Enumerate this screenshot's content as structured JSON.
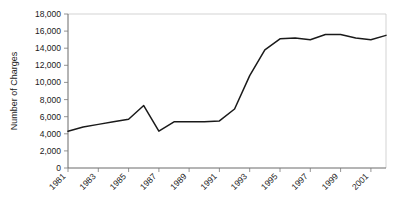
{
  "chart_data": {
    "type": "line",
    "title": "",
    "xlabel": "",
    "ylabel": "Number of Charges",
    "ylim": [
      0,
      18000
    ],
    "xlim": [
      1981,
      2002
    ],
    "grid": false,
    "legend": "none",
    "y_ticks": [
      "0",
      "2,000",
      "4,000",
      "6,000",
      "8,000",
      "10,000",
      "12,000",
      "14,000",
      "16,000",
      "18,000"
    ],
    "y_tick_values": [
      0,
      2000,
      4000,
      6000,
      8000,
      10000,
      12000,
      14000,
      16000,
      18000
    ],
    "x_ticks": [
      "1981",
      "1983",
      "1985",
      "1987",
      "1989",
      "1991",
      "1993",
      "1995",
      "1997",
      "1999",
      "2001"
    ],
    "x_tick_values": [
      1981,
      1983,
      1985,
      1987,
      1989,
      1991,
      1993,
      1995,
      1997,
      1999,
      2001
    ],
    "x": [
      1981,
      1982,
      1983,
      1984,
      1985,
      1986,
      1987,
      1988,
      1989,
      1990,
      1991,
      1992,
      1993,
      1994,
      1995,
      1996,
      1997,
      1998,
      1999,
      2000,
      2001,
      2002
    ],
    "values": [
      4300,
      4800,
      5100,
      5400,
      5700,
      7300,
      4300,
      5400,
      5400,
      5400,
      5500,
      6900,
      10800,
      13800,
      15100,
      15200,
      15000,
      15600,
      15600,
      15200,
      15000,
      15500
    ],
    "series": [
      {
        "name": "Number of Charges",
        "color": "#1a1a1a",
        "values": [
          4300,
          4800,
          5100,
          5400,
          5700,
          7300,
          4300,
          5400,
          5400,
          5400,
          5500,
          6900,
          10800,
          13800,
          15100,
          15200,
          15000,
          15600,
          15600,
          15200,
          15000,
          15500
        ]
      }
    ]
  },
  "axes": {
    "y_axis_title": "Number of Charges"
  },
  "colors": {
    "line": "#1a1a1a",
    "axis": "#5a5a5a",
    "border": "#c8c8c8",
    "background": "#ffffff",
    "text": "#1a1a1a"
  }
}
